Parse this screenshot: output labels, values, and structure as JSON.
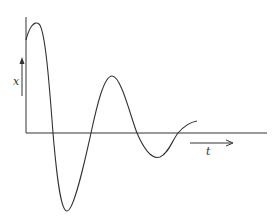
{
  "diagram": {
    "title": "",
    "type": "damped-oscillation",
    "labels": {
      "y_axis": "x",
      "x_axis": "t"
    },
    "colors": {
      "stroke": "#333333",
      "background": "#ffffff"
    },
    "curve_points": [
      [
        26,
        40
      ],
      [
        39,
        24
      ],
      [
        53,
        133
      ],
      [
        67,
        211
      ],
      [
        91,
        133
      ],
      [
        112,
        76
      ],
      [
        137,
        133
      ],
      [
        160,
        157
      ],
      [
        178,
        133
      ],
      [
        197,
        121
      ]
    ]
  }
}
